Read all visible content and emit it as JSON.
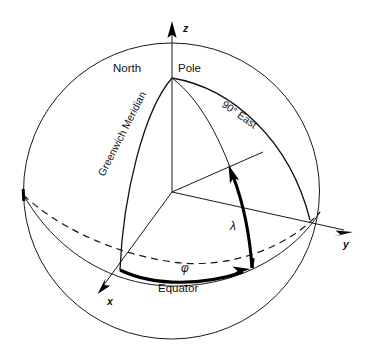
{
  "figure": {
    "type": "diagram",
    "background_color": "#ffffff",
    "line_color": "#111111"
  },
  "labels": {
    "north_pole_left": "North",
    "north_pole_right": "Pole",
    "greenwich_meridian": "Greenwich Meridian",
    "ninety_east": "90° East",
    "equator": "Equator",
    "lambda": "λ",
    "phi": "φ",
    "axis_z": "z",
    "axis_y": "y",
    "axis_x": "x"
  },
  "geometry": {
    "sphere_center": [
      171.5,
      191
    ],
    "sphere_radius": 148,
    "origin": [
      172,
      192
    ],
    "north_pole_point": [
      172,
      78
    ],
    "z_axis_tip": [
      172,
      22
    ],
    "y_axis_tip": [
      352,
      233
    ],
    "x_axis_tip": [
      98,
      294
    ],
    "greenwich_equator_point": [
      120,
      270
    ],
    "ninety_east_equator_point": [
      310,
      220
    ],
    "point_p_equator": [
      252,
      268
    ]
  }
}
